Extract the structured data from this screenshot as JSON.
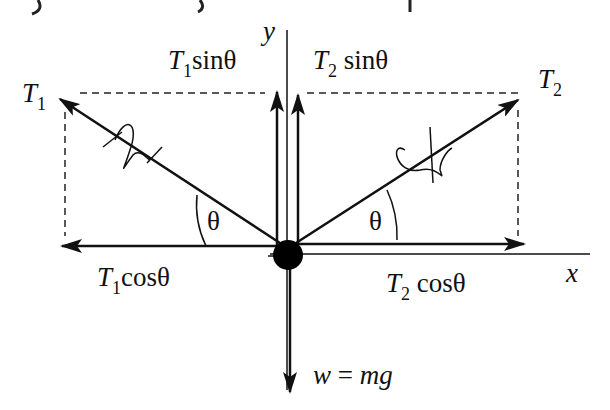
{
  "diagram": {
    "type": "free-body force diagram",
    "axes": {
      "x_label": "x",
      "y_label": "y"
    },
    "forces": {
      "T1": {
        "symbol": "T",
        "subscript": "1",
        "label": "T1"
      },
      "T2": {
        "symbol": "T",
        "subscript": "2",
        "label": "T2"
      },
      "T1_sin": {
        "symbol": "T",
        "subscript": "1",
        "func": "sinθ"
      },
      "T2_sin": {
        "symbol": "T",
        "subscript": "2",
        "func": "sinθ"
      },
      "T1_cos": {
        "symbol": "T",
        "subscript": "1",
        "func": "cosθ"
      },
      "T2_cos": {
        "symbol": "T",
        "subscript": "2",
        "func": "cosθ"
      },
      "weight": {
        "w": "w",
        "eq": " = ",
        "mg": "mg"
      }
    },
    "angles": {
      "left": "θ",
      "right": "θ"
    },
    "top_caption_fragment": ") ... g ... p"
  }
}
